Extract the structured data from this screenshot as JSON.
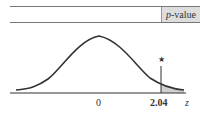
{
  "header": {
    "p_italic": "p",
    "p_rest": "-value"
  },
  "axis": {
    "center_label": "0",
    "critical_label": "2.04",
    "variable": "z"
  },
  "marker": {
    "symbol": "★"
  },
  "colors": {
    "shade": "#cfcfcf",
    "curve": "#333333"
  }
}
